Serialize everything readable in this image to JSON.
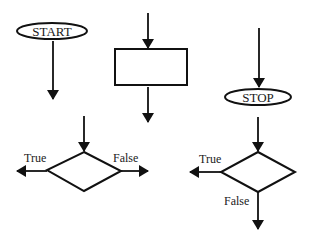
{
  "diagram": {
    "title": "",
    "colors": {
      "stroke": "#111111",
      "background": "#ffffff",
      "text": "#1a1a1a"
    },
    "shapes": {
      "start_terminal": {
        "type": "ellipse",
        "label": "START"
      },
      "process_box": {
        "type": "rectangle",
        "label": ""
      },
      "stop_terminal": {
        "type": "ellipse",
        "label": "STOP"
      },
      "decision_left": {
        "type": "diamond",
        "label": "",
        "true_label": "True",
        "false_label": "False",
        "true_direction": "left",
        "false_direction": "right"
      },
      "decision_right": {
        "type": "diamond",
        "label": "",
        "true_label": "True",
        "false_label": "False",
        "true_direction": "left",
        "false_direction": "down"
      }
    }
  }
}
